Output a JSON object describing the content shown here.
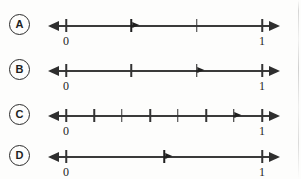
{
  "diagram": {
    "axis_min_label": "0",
    "axis_max_label": "1",
    "line_color": "#3a3a3a",
    "tick_color": "#333333",
    "marker_color": "#1f1f1f",
    "background_color": "#fdfdfc"
  },
  "options": [
    {
      "letter": "A",
      "name": "option-a",
      "divisions": 3,
      "marker_fraction": 0.3333,
      "marker_label": "1/3",
      "interior_ticks": [
        0.6667
      ],
      "start_label": "0",
      "end_label": "1"
    },
    {
      "letter": "B",
      "name": "option-b",
      "divisions": 3,
      "marker_fraction": 0.6667,
      "marker_label": "2/3",
      "interior_ticks": [
        0.3333
      ],
      "start_label": "0",
      "end_label": "1"
    },
    {
      "letter": "C",
      "name": "option-c",
      "divisions": 7,
      "marker_fraction": 0.8571,
      "marker_label": "6/7",
      "interior_ticks": [
        0.1429,
        0.2857,
        0.4286,
        0.5714,
        0.7143
      ],
      "start_label": "0",
      "end_label": "1"
    },
    {
      "letter": "D",
      "name": "option-d",
      "divisions": 2,
      "marker_fraction": 0.5,
      "marker_label": "1/2",
      "interior_ticks": [],
      "start_label": "0",
      "end_label": "1"
    }
  ]
}
